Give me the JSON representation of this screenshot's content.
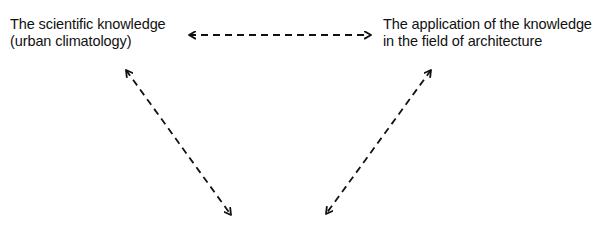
{
  "diagram": {
    "type": "triangle-relationship",
    "nodes": [
      {
        "id": "left",
        "lines": [
          "The scientific knowledge",
          "(urban climatology)"
        ]
      },
      {
        "id": "right",
        "lines": [
          "The application of the knowledge",
          "in the field of architecture"
        ]
      },
      {
        "id": "bottom",
        "lines": []
      }
    ],
    "edges": [
      {
        "from": "left",
        "to": "right",
        "style": "dashed",
        "arrows": "both"
      },
      {
        "from": "left",
        "to": "bottom",
        "style": "dashed",
        "arrows": "both"
      },
      {
        "from": "right",
        "to": "bottom",
        "style": "dashed",
        "arrows": "both"
      }
    ],
    "colors": {
      "text": "#111111",
      "line": "#111111",
      "background": "#ffffff"
    }
  }
}
